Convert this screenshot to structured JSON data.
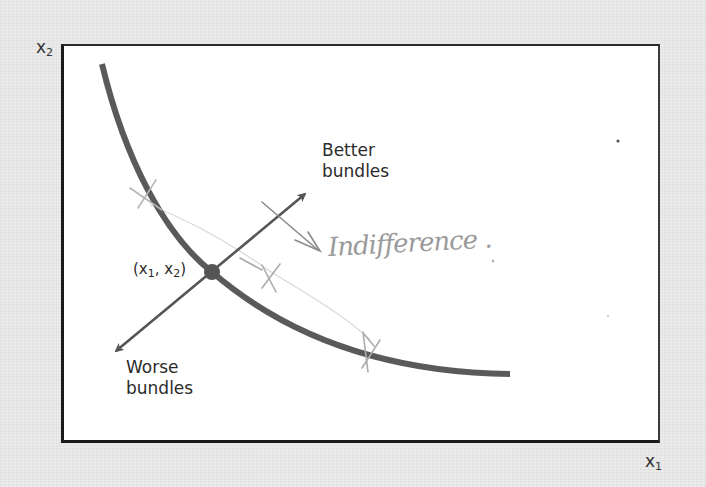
{
  "diagram": {
    "type": "indifference-curve",
    "axes": {
      "x_label": "x",
      "x_sub": "1",
      "y_label": "x",
      "y_sub": "2"
    },
    "point": {
      "label_open": "(x",
      "label_sub1": "1",
      "label_mid": ", x",
      "label_sub2": "2",
      "label_close": ")"
    },
    "better_label": {
      "line1": "Better",
      "line2": "bundles"
    },
    "worse_label": {
      "line1": "Worse",
      "line2": "bundles"
    },
    "annotation": {
      "handwritten_text": "Indifference .",
      "marks": [
        "X",
        "X",
        "X"
      ]
    },
    "colors": {
      "background": "#e6e6e6",
      "plot_area": "#ffffff",
      "curve": "#5a5a5a",
      "arrows": "#555555",
      "frame": "#1a1a1a",
      "text": "#2b2b2b",
      "pencil": "#a0a0a0"
    }
  }
}
